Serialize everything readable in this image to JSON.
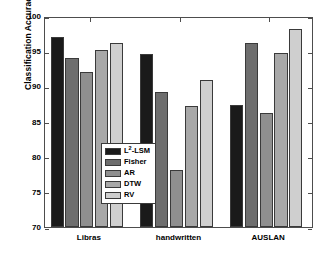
{
  "chart_data": {
    "type": "bar",
    "title": "",
    "xlabel": "",
    "ylabel": "Classification Accuracy",
    "categories": [
      "Libras",
      "handwritten",
      "AUSLAN"
    ],
    "ylim": [
      70,
      100
    ],
    "yticks": [
      70,
      75,
      80,
      85,
      90,
      95,
      100
    ],
    "grid": false,
    "legend_position": "inside-lower-left",
    "series": [
      {
        "name": "L2-LSM",
        "label_html": "L<sup>2</sup>-LSM",
        "color": "#1a1a1a",
        "values": [
          97.0,
          94.6,
          87.3
        ]
      },
      {
        "name": "Fisher",
        "label_html": "Fisher",
        "color": "#6e6e6e",
        "values": [
          94.0,
          89.2,
          96.2
        ]
      },
      {
        "name": "AR",
        "label_html": "AR",
        "color": "#8f8f8f",
        "values": [
          92.1,
          78.1,
          86.2
        ]
      },
      {
        "name": "DTW",
        "label_html": "DTW",
        "color": "#a8a8a8",
        "values": [
          95.1,
          87.2,
          94.7
        ]
      },
      {
        "name": "RV",
        "label_html": "RV",
        "color": "#cfcfcf",
        "values": [
          96.2,
          90.9,
          98.1
        ]
      }
    ]
  },
  "axes": {
    "y_label": "Classification Accuracy",
    "y_tick_labels": [
      "100",
      "95",
      "90",
      "85",
      "80",
      "75",
      "70"
    ],
    "x_tick_labels": [
      "Libras",
      "handwritten",
      "AUSLAN"
    ]
  },
  "legend": {
    "items": [
      {
        "label": "L2-LSM",
        "label_html": "L<sup>2</sup>-LSM",
        "color": "#1a1a1a"
      },
      {
        "label": "Fisher",
        "label_html": "Fisher",
        "color": "#6e6e6e"
      },
      {
        "label": "AR",
        "label_html": "AR",
        "color": "#8f8f8f"
      },
      {
        "label": "DTW",
        "label_html": "DTW",
        "color": "#a8a8a8"
      },
      {
        "label": "RV",
        "label_html": "RV",
        "color": "#cfcfcf"
      }
    ]
  },
  "style": {
    "background": "#ffffff",
    "axis_color": "#4d4d4d",
    "bar_edge_color": "#3a3a3a",
    "text_color": "#000000"
  }
}
